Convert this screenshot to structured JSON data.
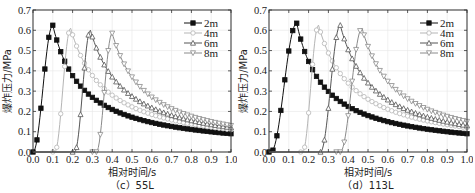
{
  "chart_data": [
    {
      "type": "line",
      "title": "",
      "caption": "（c）55L",
      "xlabel": "相对时间/s",
      "ylabel": "爆炸压力/MPa",
      "xlim": [
        0.0,
        1.0
      ],
      "ylim": [
        0.0,
        0.7
      ],
      "xticks": [
        "0.0",
        "0.1",
        "0.2",
        "0.3",
        "0.4",
        "0.5",
        "0.6",
        "0.7",
        "0.8",
        "0.9",
        "1.0"
      ],
      "yticks": [
        "0.0",
        "0.1",
        "0.2",
        "0.3",
        "0.4",
        "0.5",
        "0.6",
        "0.7"
      ],
      "grid": true,
      "legend_position": "upper right",
      "series": [
        {
          "name": "2m",
          "marker": "filled-square",
          "color": "#111111",
          "onset": 0.0,
          "peak_t": 0.1,
          "peak": 0.625,
          "end": 0.09
        },
        {
          "name": "4m",
          "marker": "open-circle",
          "color": "#b5b5b5",
          "onset": 0.11,
          "peak_t": 0.19,
          "peak": 0.61,
          "end": 0.11
        },
        {
          "name": "6m",
          "marker": "open-triangle-up",
          "color": "#555555",
          "onset": 0.21,
          "peak_t": 0.29,
          "peak": 0.6,
          "end": 0.12
        },
        {
          "name": "8m",
          "marker": "open-triangle-down",
          "color": "#8a8a8a",
          "onset": 0.32,
          "peak_t": 0.4,
          "peak": 0.585,
          "end": 0.13
        }
      ]
    },
    {
      "type": "line",
      "title": "",
      "caption": "（d）113L",
      "xlabel": "相对时间/s",
      "ylabel": "爆炸压力/MPa",
      "xlim": [
        0.0,
        1.0
      ],
      "ylim": [
        0.0,
        0.7
      ],
      "xticks": [
        "0.0",
        "0.1",
        "0.2",
        "0.3",
        "0.4",
        "0.5",
        "0.6",
        "0.7",
        "0.8",
        "0.9",
        "1.0"
      ],
      "yticks": [
        "0.0",
        "0.1",
        "0.2",
        "0.3",
        "0.4",
        "0.5",
        "0.6",
        "0.7"
      ],
      "grid": true,
      "legend_position": "upper right",
      "series": [
        {
          "name": "2m",
          "marker": "filled-square",
          "color": "#111111",
          "onset": 0.01,
          "peak_t": 0.14,
          "peak": 0.635,
          "end": 0.09
        },
        {
          "name": "4m",
          "marker": "open-circle",
          "color": "#b5b5b5",
          "onset": 0.17,
          "peak_t": 0.25,
          "peak": 0.625,
          "end": 0.12
        },
        {
          "name": "6m",
          "marker": "open-triangle-up",
          "color": "#555555",
          "onset": 0.26,
          "peak_t": 0.36,
          "peak": 0.625,
          "end": 0.13
        },
        {
          "name": "8m",
          "marker": "open-triangle-down",
          "color": "#8a8a8a",
          "onset": 0.36,
          "peak_t": 0.47,
          "peak": 0.61,
          "end": 0.15
        }
      ]
    }
  ]
}
